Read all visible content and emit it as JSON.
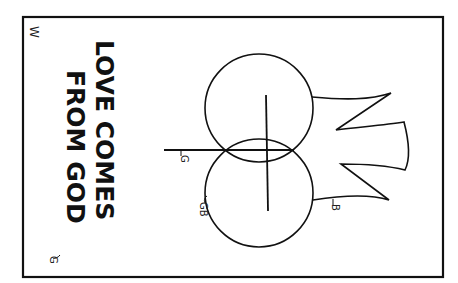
{
  "illustration": {
    "title_lines": [
      "LOVE COMES",
      "FROM GOD"
    ],
    "color_keys": {
      "corner": "W",
      "title": "G",
      "horizontal_bar": "G",
      "lower_circle": "GB",
      "banner": "B"
    },
    "colors": {
      "line": "#111111",
      "background": "#ffffff"
    }
  }
}
